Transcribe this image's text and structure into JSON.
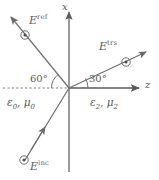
{
  "figure": {
    "kind": "electromagnetic-wave-interface-diagram",
    "background_color": "#ffffff",
    "stroke_color": "#5a5a5a",
    "text_color": "#5a5a5a",
    "width": 159,
    "height": 180
  },
  "axes": {
    "vertical": {
      "name": "x-axis",
      "label": "x",
      "label_x": 64,
      "label_y": 3,
      "arrow": "up"
    },
    "horizontal": {
      "name": "z-axis",
      "label": "z",
      "label_x": 146,
      "label_y": 82,
      "arrow": "right"
    },
    "origin": {
      "x": 69,
      "y": 88
    },
    "interface_note": "vertical x-axis is the material interface"
  },
  "waves": [
    {
      "id": "incident",
      "name": "incident-wave",
      "label": "E",
      "superscript": "inc",
      "label_x": 30,
      "label_y": 156,
      "direction": "up-right toward origin",
      "tail": {
        "x": 22,
        "y": 163
      },
      "tip": {
        "x": 69,
        "y": 88
      },
      "arrow_tip": {
        "x": 42,
        "y": 130
      },
      "marker": {
        "type": "circle-dot",
        "x": 24,
        "y": 160
      },
      "angle_deg": 60
    },
    {
      "id": "reflected",
      "name": "reflected-wave",
      "label": "E",
      "superscript": "ref",
      "label_x": 29,
      "label_y": 16,
      "direction": "up-left away from origin",
      "tail": {
        "x": 69,
        "y": 88
      },
      "tip": {
        "x": 9,
        "y": 15
      },
      "marker": {
        "type": "circle-dot",
        "x": 25,
        "y": 35
      },
      "angle_deg": 60
    },
    {
      "id": "transmitted",
      "name": "transmitted-wave",
      "label": "E",
      "superscript": "trs",
      "label_x": 100,
      "label_y": 44,
      "direction": "up-right away from origin",
      "tail": {
        "x": 69,
        "y": 88
      },
      "tip": {
        "x": 148,
        "y": 51
      },
      "marker": {
        "type": "circle-dot",
        "x": 126,
        "y": 62
      },
      "angle_deg": 30
    }
  ],
  "angles": [
    {
      "id": "reflection-angle",
      "name": "angle-60",
      "text": "60°",
      "label_x": 36,
      "label_y": 79,
      "arc_radius": 22,
      "from_deg": 180,
      "to_deg": 128
    },
    {
      "id": "transmission-angle",
      "name": "angle-30",
      "text": "30°",
      "label_x": 92,
      "label_y": 79,
      "arc_radius": 22,
      "from_deg": 0,
      "to_deg": 25
    }
  ],
  "media": [
    {
      "id": "left-medium",
      "name": "medium-left",
      "permittivity": "ε",
      "permittivity_sub": "0",
      "separator": ", ",
      "permeability": "μ",
      "permeability_sub": "0",
      "label_x": 7,
      "label_y": 99
    },
    {
      "id": "right-medium",
      "name": "medium-right",
      "permittivity": "ε",
      "permittivity_sub": "2",
      "separator": ", ",
      "permeability": "μ",
      "permeability_sub": "2",
      "label_x": 90,
      "label_y": 99
    }
  ],
  "dashed_line": {
    "name": "normal-reference-dashed-line",
    "from": {
      "x": 3,
      "y": 88
    },
    "to": {
      "x": 69,
      "y": 88
    },
    "style": "dashed"
  }
}
